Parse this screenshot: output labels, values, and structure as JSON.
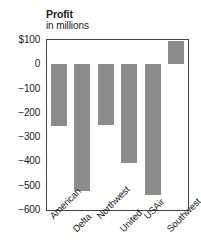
{
  "chart_data": {
    "type": "bar",
    "title": "Profit",
    "subtitle": "in millions",
    "xlabel": "",
    "ylabel": "",
    "categories": [
      "American",
      "Delta",
      "Northwest",
      "United",
      "USAir",
      "Southwest"
    ],
    "values": [
      -255,
      -520,
      -250,
      -405,
      -540,
      95
    ],
    "ylim": [
      -600,
      100
    ],
    "yticks": [
      100,
      0,
      -100,
      -200,
      -300,
      -400,
      -500,
      -600
    ],
    "ytick_labels": [
      "$100",
      "0",
      "−100",
      "−200",
      "−300",
      "−400",
      "−500",
      "−600"
    ],
    "grid": false,
    "legend": "none",
    "bar_color": "#8c8c8c",
    "frame_color": "#444444",
    "background": "#ffffff",
    "xlabel_rotation": -45
  }
}
